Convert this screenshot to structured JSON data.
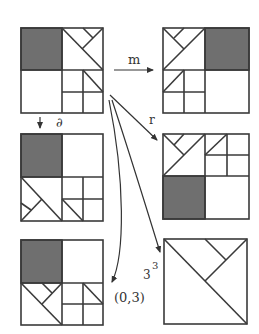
{
  "diagram": {
    "colors": {
      "stroke": "#3a3a3a",
      "shade": "#6f6f6f",
      "background": "#ffffff"
    },
    "panels": [
      {
        "id": "source",
        "position": "top-left"
      },
      {
        "id": "m-image",
        "position": "top-right"
      },
      {
        "id": "d-image",
        "position": "middle-left"
      },
      {
        "id": "r-image",
        "position": "middle-right"
      },
      {
        "id": "03-image",
        "position": "bottom-left"
      },
      {
        "id": "33-image",
        "position": "bottom-right"
      }
    ],
    "arrows": [
      {
        "from": "source",
        "to": "m-image",
        "label": "m"
      },
      {
        "from": "source",
        "to": "d-image",
        "label": "∂"
      },
      {
        "from": "source",
        "to": "r-image",
        "label": "r"
      },
      {
        "from": "source",
        "to": "03-image",
        "label": "(0,3)"
      },
      {
        "from": "source",
        "to": "33-image",
        "label_base": "3",
        "label_sup": "3"
      }
    ]
  }
}
